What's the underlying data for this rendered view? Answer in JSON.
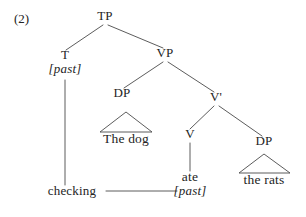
{
  "figure": {
    "example_number": "(2)",
    "caption_note": "Syntax tree: TP with T [past] checking V ate [past]"
  },
  "tree": {
    "nodes": [
      {
        "id": "tp",
        "label": "TP",
        "x": 105,
        "y": 20,
        "kind": "category"
      },
      {
        "id": "t",
        "label": "T",
        "x": 65,
        "y": 59,
        "kind": "category"
      },
      {
        "id": "t_feat",
        "label": "[past]",
        "x": 65,
        "y": 73,
        "kind": "feature"
      },
      {
        "id": "vp",
        "label": "VP",
        "x": 165,
        "y": 57,
        "kind": "category"
      },
      {
        "id": "dp_subj",
        "label": "DP",
        "x": 122,
        "y": 97,
        "kind": "category"
      },
      {
        "id": "vbar",
        "label": "V'",
        "x": 216,
        "y": 101,
        "kind": "category"
      },
      {
        "id": "subj",
        "label": "The dog",
        "x": 126,
        "y": 143,
        "kind": "leaf"
      },
      {
        "id": "v",
        "label": "V",
        "x": 190,
        "y": 138,
        "kind": "category"
      },
      {
        "id": "dp_obj",
        "label": "DP",
        "x": 264,
        "y": 145,
        "kind": "category"
      },
      {
        "id": "obj",
        "label": "the rats",
        "x": 264,
        "y": 184,
        "kind": "leaf"
      },
      {
        "id": "verb",
        "label": "ate",
        "x": 190,
        "y": 181,
        "kind": "leaf"
      },
      {
        "id": "v_feat",
        "label": "[past]",
        "x": 190,
        "y": 195,
        "kind": "feature"
      },
      {
        "id": "checking",
        "label": "checking",
        "x": 72,
        "y": 195,
        "kind": "annotation"
      }
    ],
    "branches": [
      {
        "from": "tp",
        "to": "t",
        "x1": 103,
        "y1": 25,
        "x2": 66,
        "y2": 50
      },
      {
        "from": "tp",
        "to": "vp",
        "x1": 108,
        "y1": 25,
        "x2": 163,
        "y2": 48
      },
      {
        "from": "vp",
        "to": "dp_subj",
        "x1": 163,
        "y1": 62,
        "x2": 124,
        "y2": 88
      },
      {
        "from": "vp",
        "to": "vbar",
        "x1": 168,
        "y1": 62,
        "x2": 214,
        "y2": 92
      },
      {
        "from": "vbar",
        "to": "v",
        "x1": 214,
        "y1": 106,
        "x2": 190,
        "y2": 129
      },
      {
        "from": "vbar",
        "to": "dp_obj",
        "x1": 219,
        "y1": 106,
        "x2": 262,
        "y2": 136
      },
      {
        "from": "v",
        "to": "verb",
        "x1": 190,
        "y1": 143,
        "x2": 190,
        "y2": 171
      },
      {
        "from": "t_feat",
        "to": "checking",
        "x1": 65,
        "y1": 80,
        "x2": 65,
        "y2": 185
      }
    ],
    "triangles": [
      {
        "for": "dp_subj",
        "apex_x": 126,
        "apex_y": 112,
        "left_x": 100,
        "right_x": 152,
        "base_y": 132
      },
      {
        "for": "dp_obj",
        "apex_x": 264,
        "apex_y": 154,
        "left_x": 239,
        "right_x": 290,
        "base_y": 173
      }
    ],
    "checking_line": {
      "x1": 106,
      "y1": 191,
      "x2": 177,
      "y2": 191
    }
  },
  "style": {
    "line_color": "#4a4a4a",
    "text_color": "#242424",
    "background": "#ffffff"
  }
}
